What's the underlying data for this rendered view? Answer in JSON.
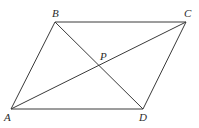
{
  "diagram": {
    "type": "parallelogram-with-diagonals",
    "stroke_color": "#3a3a3a",
    "label_color": "#2b2b2b",
    "points": {
      "A": {
        "label": "A",
        "x": 11,
        "y": 109,
        "lx": 4,
        "ly": 121
      },
      "B": {
        "label": "B",
        "x": 55,
        "y": 22,
        "lx": 52,
        "ly": 17
      },
      "C": {
        "label": "C",
        "x": 186,
        "y": 22,
        "lx": 184,
        "ly": 17
      },
      "D": {
        "label": "D",
        "x": 143,
        "y": 109,
        "lx": 139,
        "ly": 121
      },
      "P": {
        "label": "P",
        "x": 99,
        "y": 66,
        "lx": 100,
        "ly": 60
      }
    },
    "segments": [
      {
        "name": "side-ab",
        "from": "A",
        "to": "B"
      },
      {
        "name": "side-bc",
        "from": "B",
        "to": "C"
      },
      {
        "name": "side-cd",
        "from": "C",
        "to": "D"
      },
      {
        "name": "side-da",
        "from": "D",
        "to": "A"
      },
      {
        "name": "diagonal-ac",
        "from": "A",
        "to": "C"
      },
      {
        "name": "diagonal-bd",
        "from": "B",
        "to": "D"
      }
    ]
  }
}
